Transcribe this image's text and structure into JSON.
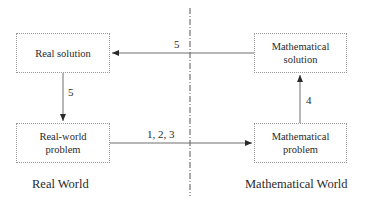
{
  "diagram": {
    "nodes": {
      "real_solution": {
        "lines": [
          "Real solution"
        ]
      },
      "real_world_problem": {
        "lines": [
          "Real-world",
          "problem"
        ]
      },
      "mathematical_solution": {
        "lines": [
          "Mathematical",
          "solution"
        ]
      },
      "mathematical_problem": {
        "lines": [
          "Mathematical",
          "problem"
        ]
      }
    },
    "edges": {
      "math_solution_to_real_solution": {
        "label": "5"
      },
      "real_solution_to_real_world_problem": {
        "label": "5"
      },
      "real_world_problem_to_math_problem": {
        "label": "1, 2, 3"
      },
      "math_problem_to_math_solution": {
        "label": "4"
      }
    },
    "regions": {
      "left": "Real World",
      "right": "Mathematical World"
    },
    "colors": {
      "line": "#6e6e6e",
      "divider": "#555555",
      "box_border": "#9a9a9a",
      "text": "#2a2a2a"
    }
  }
}
